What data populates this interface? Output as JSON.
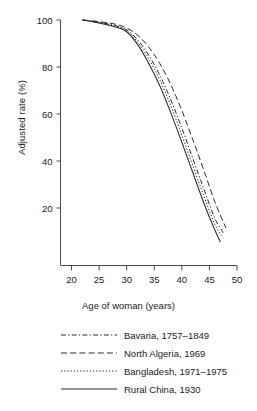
{
  "chart_data": {
    "type": "line",
    "title": "",
    "xlabel": "Age of woman (years)",
    "ylabel": "Adjusted rate (%)",
    "xlim": [
      18,
      50
    ],
    "ylim": [
      0,
      104
    ],
    "xticks": [
      20,
      25,
      30,
      35,
      40,
      45,
      50
    ],
    "yticks": [
      20,
      40,
      60,
      80,
      100
    ],
    "grid": false,
    "legend_position": "below",
    "series": [
      {
        "name": "Bavaria, 1757–1849",
        "linestyle": "dashdot",
        "color": "#2b2b2b",
        "x": [
          22,
          24,
          26,
          28,
          30,
          32,
          34,
          36,
          38,
          40,
          42,
          44,
          46,
          47.5
        ],
        "y": [
          100,
          99.4,
          98.6,
          97.6,
          95.8,
          91.5,
          85.0,
          76.5,
          66.0,
          54.0,
          41.0,
          28.0,
          15.5,
          9.5
        ]
      },
      {
        "name": "North Algeria, 1969",
        "linestyle": "dashed",
        "color": "#2b2b2b",
        "x": [
          22,
          24,
          26,
          28,
          30,
          32,
          34,
          36,
          38,
          40,
          42,
          44,
          46,
          48
        ],
        "y": [
          100,
          99.6,
          99.0,
          98.2,
          96.6,
          93.5,
          88.5,
          81.5,
          72.5,
          61.5,
          49.0,
          36.0,
          22.5,
          11.5
        ]
      },
      {
        "name": "Bangladesh, 1971–1975",
        "linestyle": "dotted",
        "color": "#2b2b2b",
        "x": [
          22,
          24,
          26,
          28,
          30,
          32,
          34,
          36,
          38,
          40,
          42,
          44,
          46,
          47.5
        ],
        "y": [
          100,
          99.3,
          98.4,
          97.3,
          95.4,
          90.6,
          83.5,
          74.5,
          63.5,
          51.0,
          38.0,
          25.0,
          13.0,
          7.5
        ]
      },
      {
        "name": "Rural China, 1930",
        "linestyle": "solid",
        "color": "#2b2b2b",
        "x": [
          22,
          24,
          26,
          28,
          30,
          32,
          34,
          36,
          38,
          40,
          42,
          44,
          46,
          47
        ],
        "y": [
          100,
          99.2,
          98.2,
          97.0,
          95.0,
          89.5,
          81.5,
          72.0,
          60.5,
          48.0,
          35.0,
          22.0,
          10.5,
          5.5
        ]
      }
    ]
  },
  "legend": {
    "items": [
      {
        "label": "Bavaria, 1757–1849",
        "style": "dashdot"
      },
      {
        "label": "North Algeria, 1969",
        "style": "dashed"
      },
      {
        "label": "Bangladesh, 1971–1975",
        "style": "dotted"
      },
      {
        "label": "Rural China, 1930",
        "style": "solid"
      }
    ]
  },
  "axes": {
    "x_title": "Age of woman (years)",
    "y_title": "Adjusted rate (%)",
    "x_tick_labels": [
      "20",
      "25",
      "30",
      "35",
      "40",
      "45",
      "50"
    ],
    "y_tick_labels": [
      "20",
      "40",
      "60",
      "80",
      "100"
    ]
  },
  "colors": {
    "line": "#2b2b2b",
    "axis": "#4a4a4a",
    "text": "#1a1a1a",
    "background": "#ffffff"
  }
}
